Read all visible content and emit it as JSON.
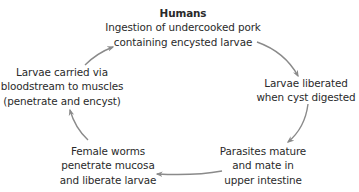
{
  "diagram": {
    "type": "life-cycle",
    "nodes": [
      {
        "id": "humans",
        "title": "Humans",
        "lines": [
          "Ingestion of undercooked pork",
          "containing encysted larvae"
        ]
      },
      {
        "id": "liberated",
        "lines": [
          "Larvae liberated",
          "when cyst digested"
        ]
      },
      {
        "id": "mature",
        "lines": [
          "Parasites mature",
          "and mate in",
          "upper intestine"
        ]
      },
      {
        "id": "female",
        "lines": [
          "Female worms",
          "penetrate mucosa",
          "and liberate larvae"
        ]
      },
      {
        "id": "carried",
        "lines": [
          "Larvae carried via",
          "bloodstream to muscles",
          "(penetrate and encyst)"
        ]
      }
    ],
    "edges": [
      {
        "from": "humans",
        "to": "liberated"
      },
      {
        "from": "liberated",
        "to": "mature"
      },
      {
        "from": "mature",
        "to": "female"
      },
      {
        "from": "female",
        "to": "carried"
      },
      {
        "from": "carried",
        "to": "humans"
      }
    ],
    "arrow_color": "#8a8a8a",
    "text_color": "#2a2a2a"
  }
}
